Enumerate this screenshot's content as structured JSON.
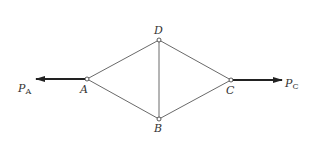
{
  "diagram": {
    "type": "truss-rhombus",
    "colors": {
      "line": "#6a6a6a",
      "arrow": "#222222",
      "text": "#333333",
      "node_fill": "#ffffff"
    },
    "nodes": [
      {
        "id": "A",
        "label": "A",
        "x": 87,
        "y": 79,
        "label_x": 80,
        "label_y": 93
      },
      {
        "id": "D",
        "label": "D",
        "x": 159,
        "y": 40,
        "label_x": 154,
        "label_y": 34
      },
      {
        "id": "C",
        "label": "C",
        "x": 231,
        "y": 80,
        "label_x": 226,
        "label_y": 94
      },
      {
        "id": "B",
        "label": "B",
        "x": 159,
        "y": 119,
        "label_x": 154,
        "label_y": 132
      }
    ],
    "members": [
      {
        "from": "A",
        "to": "D"
      },
      {
        "from": "D",
        "to": "C"
      },
      {
        "from": "C",
        "to": "B"
      },
      {
        "from": "B",
        "to": "A"
      },
      {
        "from": "D",
        "to": "B"
      }
    ],
    "forces": [
      {
        "id": "PA",
        "symbol": "P",
        "subscript": "A",
        "at": "A",
        "x1": 87,
        "y1": 79,
        "x2": 36,
        "y2": 79,
        "label_x": 18,
        "label_y": 92
      },
      {
        "id": "PC",
        "symbol": "P",
        "subscript": "C",
        "at": "C",
        "x1": 231,
        "y1": 80,
        "x2": 282,
        "y2": 80,
        "label_x": 285,
        "label_y": 87
      }
    ]
  }
}
